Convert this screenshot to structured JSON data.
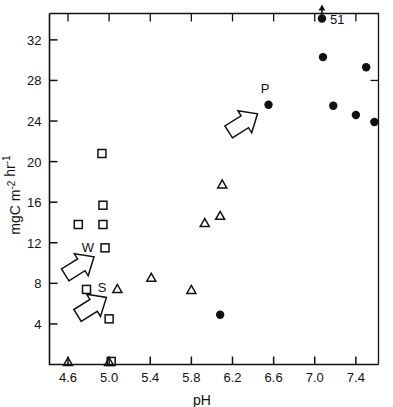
{
  "chart_data": {
    "type": "scatter",
    "title": "",
    "xlabel": "pH",
    "ylabel": "mgC m⁻² hr⁻¹",
    "ylabel_parts": {
      "base": "mgC m",
      "sup1": "-2",
      "mid": " hr",
      "sup2": "-1"
    },
    "xlim": [
      4.42,
      7.62
    ],
    "ylim": [
      0.0,
      34.6
    ],
    "xticks": [
      4.6,
      5.0,
      5.4,
      5.8,
      6.2,
      6.6,
      7.0,
      7.4
    ],
    "xticklabels": [
      "4.6",
      "5.0",
      "5.4",
      "5.8",
      "6.2",
      "6.6",
      "7.0",
      "7.4"
    ],
    "yticks": [
      4,
      8,
      12,
      16,
      20,
      24,
      28,
      32
    ],
    "yticklabels": [
      "4",
      "8",
      "12",
      "16",
      "20",
      "24",
      "28",
      "32"
    ],
    "grid": false,
    "legend": null,
    "series": [
      {
        "name": "W",
        "marker": "open-square",
        "points": [
          {
            "x": 4.7,
            "y": 13.8
          },
          {
            "x": 4.78,
            "y": 7.4
          },
          {
            "x": 4.93,
            "y": 20.8
          },
          {
            "x": 4.94,
            "y": 15.7
          },
          {
            "x": 4.94,
            "y": 13.8
          },
          {
            "x": 4.96,
            "y": 11.5
          },
          {
            "x": 5.0,
            "y": 4.5
          },
          {
            "x": 5.02,
            "y": 0.3
          }
        ]
      },
      {
        "name": "S",
        "marker": "open-triangle",
        "points": [
          {
            "x": 4.6,
            "y": 0.3
          },
          {
            "x": 5.0,
            "y": 0.3
          },
          {
            "x": 5.08,
            "y": 7.5
          },
          {
            "x": 5.41,
            "y": 8.6
          },
          {
            "x": 5.8,
            "y": 7.4
          },
          {
            "x": 5.93,
            "y": 14.0
          },
          {
            "x": 6.08,
            "y": 14.7
          },
          {
            "x": 6.1,
            "y": 17.8
          }
        ]
      },
      {
        "name": "P",
        "marker": "filled-circle",
        "points": [
          {
            "x": 6.08,
            "y": 4.9
          },
          {
            "x": 6.55,
            "y": 25.6
          },
          {
            "x": 7.07,
            "y": 34.1
          },
          {
            "x": 7.08,
            "y": 30.3
          },
          {
            "x": 7.18,
            "y": 25.5
          },
          {
            "x": 7.4,
            "y": 24.6
          },
          {
            "x": 7.5,
            "y": 29.3
          },
          {
            "x": 7.58,
            "y": 23.9
          }
        ]
      }
    ],
    "annotations": [
      {
        "label": "W",
        "kind": "arrow-label",
        "target_x": 4.96,
        "target_y": 11.5
      },
      {
        "label": "S",
        "kind": "arrow-label",
        "target_x": 5.08,
        "target_y": 7.5
      },
      {
        "label": "P",
        "kind": "arrow-label",
        "target_x": 6.55,
        "target_y": 25.6
      },
      {
        "label": "51",
        "kind": "offscale-value",
        "target_x": 7.07,
        "target_y": 34.1
      }
    ]
  }
}
